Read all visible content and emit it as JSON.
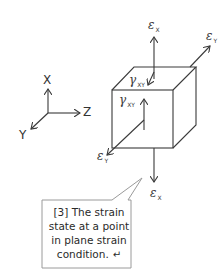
{
  "axes": {
    "x_label": "X",
    "y_label": "Y",
    "z_label": "Z"
  },
  "strain_labels": {
    "epsilon_x_top": {
      "symbol": "ε",
      "sub": "X"
    },
    "epsilon_y_right": {
      "symbol": "ε",
      "sub": "Y"
    },
    "gamma_xy_top": {
      "symbol": "γ",
      "sub": "XY"
    },
    "gamma_xy_front": {
      "symbol": "γ",
      "sub": "XY"
    },
    "epsilon_y_left": {
      "symbol": "ε",
      "sub": "Y"
    },
    "epsilon_x_bottom": {
      "symbol": "ε",
      "sub": "X"
    }
  },
  "callout": {
    "lines": [
      "[3] The strain",
      "state at a point",
      "in plane strain",
      "condition."
    ],
    "return_glyph": "↵"
  },
  "colors": {
    "line": "#3a3a3a",
    "callout_border": "#9a9a9a",
    "background": "#ffffff"
  }
}
